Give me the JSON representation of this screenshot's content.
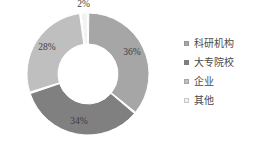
{
  "chart_data": {
    "type": "pie",
    "variant": "doughnut",
    "title": "",
    "subtitle": "",
    "xlabel": "",
    "ylabel": "",
    "categories": [
      "科研机构",
      "大专院校",
      "企业",
      "其他"
    ],
    "values": [
      36,
      34,
      28,
      2
    ],
    "data_labels": [
      "36%",
      "34%",
      "28%",
      "2%"
    ],
    "value_unit": "%",
    "colors": [
      "#a6a6a6",
      "#808080",
      "#bfbfbf",
      "#f2f2f2"
    ],
    "legend_position": "right",
    "grid": false,
    "start_angle_deg": 0,
    "direction": "clockwise",
    "slices": [
      {
        "label": "科研机构",
        "value": 36,
        "data_label": "36%",
        "color": "#a6a6a6"
      },
      {
        "label": "大专院校",
        "value": 34,
        "data_label": "34%",
        "color": "#808080"
      },
      {
        "label": "企业",
        "value": 28,
        "data_label": "28%",
        "color": "#bfbfbf"
      },
      {
        "label": "其他",
        "value": 2,
        "data_label": "2%",
        "color": "#f2f2f2"
      }
    ]
  },
  "legend": {
    "items": [
      {
        "label": "科研机构",
        "color": "#a6a6a6"
      },
      {
        "label": "大专院校",
        "color": "#808080"
      },
      {
        "label": "企业",
        "color": "#bfbfbf"
      },
      {
        "label": "其他",
        "color": "#f2f2f2"
      }
    ]
  },
  "labels": {
    "slice_1": "36%",
    "slice_2": "34%",
    "slice_3": "28%",
    "slice_4": "2%"
  }
}
